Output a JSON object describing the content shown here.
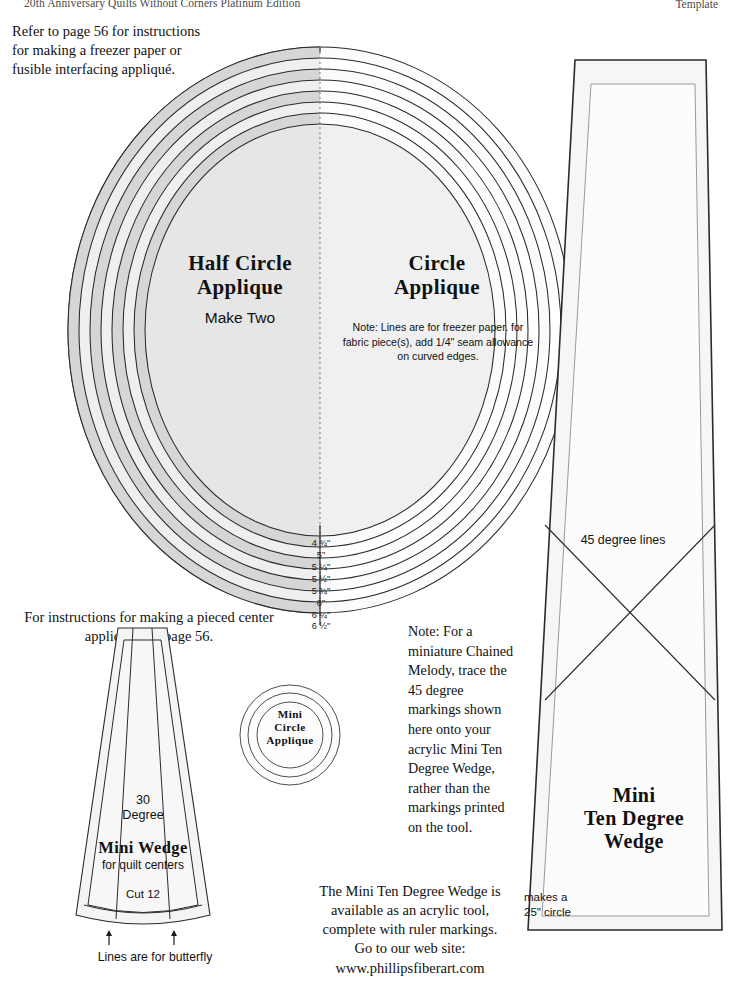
{
  "header": {
    "left_title": "20th Anniversary Quilts Without Corners Platinum Edition",
    "right_title": "Template"
  },
  "instructions": {
    "refer_text": "Refer to page 56 for instructions for making a freezer paper or fusible interfacing appliqué.",
    "pieced_center_text": "For instructions for making a pieced center applique, see page 56."
  },
  "half_circle": {
    "title_line1": "Half Circle",
    "title_line2": "Applique",
    "subtitle": "Make Two"
  },
  "circle_applique": {
    "title_line1": "Circle",
    "title_line2": "Applique",
    "note": "Note: Lines are for freezer paper. for fabric piece(s), add 1/4\" seam allowance on curved edges."
  },
  "size_ticks": [
    {
      "label": "4 ¾\"",
      "y": 538
    },
    {
      "label": "5\"",
      "y": 550
    },
    {
      "label": "5 ¼\"",
      "y": 562
    },
    {
      "label": "5 ½\"",
      "y": 574
    },
    {
      "label": "5 ¾\"",
      "y": 586
    },
    {
      "label": "6\"",
      "y": 598
    },
    {
      "label": "6 ¼\"",
      "y": 610
    },
    {
      "label": "6 ½\"",
      "y": 621
    }
  ],
  "mini_wedge": {
    "degree_line1": "30",
    "degree_line2": "Degree",
    "title": "Mini Wedge",
    "subtitle": "for quilt centers",
    "cut": "Cut 12",
    "caption": "Lines are for butterfly"
  },
  "mini_circle": {
    "line1": "Mini",
    "line2": "Circle",
    "line3": "Applique"
  },
  "ten_degree_wedge": {
    "degree_lines_label": "45 degree lines",
    "title_line1": "Mini",
    "title_line2": "Ten Degree",
    "title_line3": "Wedge",
    "makes_line1": "makes a",
    "makes_line2": "25\" circle",
    "note": "Note: For a miniature Chained Melody, trace the 45 degree markings shown here onto your acrylic Mini Ten Degree Wedge, rather than the markings printed on the tool."
  },
  "footer": {
    "acrylic_text": "The Mini Ten Degree Wedge is available as an acrylic tool, complete with ruler markings. Go to our web site: www.phillipsfiberart.com"
  },
  "colors": {
    "ink": "#111111",
    "header_ink": "#4a4a4a",
    "ring_light": "#f1f1f1",
    "ring_shade": "#d9d9d9",
    "fill_pale": "#f4f4f4",
    "stroke": "#2b2b2b"
  }
}
